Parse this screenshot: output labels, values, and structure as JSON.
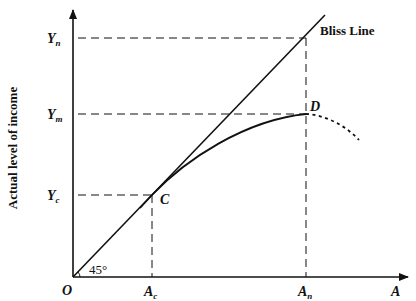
{
  "diagram": {
    "y_axis_label": "Actual level of income",
    "x_axis_label": "A",
    "origin_label": "O",
    "angle_label": "45°",
    "bliss_line_label": "Bliss Line",
    "y_ticks": [
      {
        "main": "Y",
        "sub": "n"
      },
      {
        "main": "Y",
        "sub": "m"
      },
      {
        "main": "Y",
        "sub": "c"
      }
    ],
    "x_ticks": [
      {
        "main": "A",
        "sub": "c"
      },
      {
        "main": "A",
        "sub": "n"
      }
    ],
    "points": [
      {
        "label": "C"
      },
      {
        "label": "D"
      }
    ],
    "colors": {
      "line": "#111111",
      "background": "#ffffff"
    }
  }
}
